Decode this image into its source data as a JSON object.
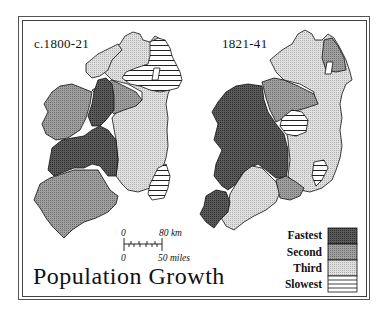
{
  "maps": [
    {
      "id": "left",
      "period_label": "c.1800-21"
    },
    {
      "id": "right",
      "period_label": "1821-41"
    }
  ],
  "title": "Population Growth",
  "scale_bar": {
    "km_start": "0",
    "km_end": "80 km",
    "miles_start": "0",
    "miles_end": "50 miles"
  },
  "legend": {
    "items": [
      {
        "label": "Fastest",
        "color": "#4a4a4a"
      },
      {
        "label": "Second",
        "color": "#8c8c8c"
      },
      {
        "label": "Third",
        "color": "#cfcfcf"
      },
      {
        "label": "Slowest",
        "pattern": "horizontal-lines"
      }
    ]
  },
  "colors": {
    "fastest": "#4a4a4a",
    "second": "#8c8c8c",
    "third": "#cfcfcf",
    "slowest_bg": "#ffffff",
    "stroke": "#111111"
  }
}
